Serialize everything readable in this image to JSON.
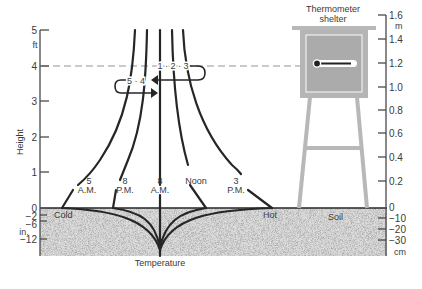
{
  "diagram": {
    "left_axis": {
      "label": "Height",
      "unit_upper": "ft",
      "unit_lower": "in.",
      "ticks_above": [
        "5",
        "4",
        "3",
        "2",
        "1",
        "0"
      ],
      "ticks_below": [
        "−2",
        "−6",
        "−12"
      ]
    },
    "right_axis": {
      "unit_upper": "m",
      "unit_lower": "cm",
      "ticks_above": [
        "1.6",
        "1.4",
        "1.2",
        "1.0",
        "0.8",
        "0.6",
        "0.4",
        "0.2",
        "0"
      ],
      "ticks_below": [
        "−10",
        "−20",
        "−30"
      ]
    },
    "x_axis": {
      "label": "Temperature",
      "cold_label": "Cold",
      "hot_label": "Hot"
    },
    "soil_label": "Soil",
    "shelter": {
      "label_line1": "Thermometer",
      "label_line2": "shelter"
    },
    "curves": [
      {
        "time_line1": "5",
        "time_line2": "A.M."
      },
      {
        "time_line1": "8",
        "time_line2": "P.M."
      },
      {
        "time_line1": "8",
        "time_line2": "A.M."
      },
      {
        "time_line1": "Noon",
        "time_line2": ""
      },
      {
        "time_line1": "3",
        "time_line2": "P.M."
      }
    ],
    "arrows": {
      "upper_label": "1 · 2 · 3",
      "lower_label": "5 · 4"
    },
    "colors": {
      "curve": "#262626",
      "axis": "#4a4a4a",
      "soil": "#c8c8c8",
      "shelter": "#b3b3b3",
      "shelter_inner": "#a9a9a9"
    }
  }
}
